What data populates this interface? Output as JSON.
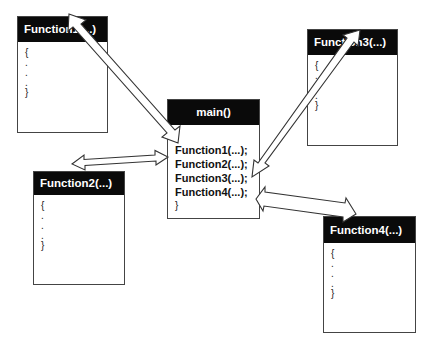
{
  "diagram": {
    "main": {
      "title": "main()",
      "lines": [
        "Function1(...);",
        "Function2(...);",
        "Function3(...);",
        "Function4(...);",
        "}"
      ]
    },
    "functions": [
      {
        "title": "Function1(...)",
        "lines": [
          "{",
          ".",
          ".",
          ".",
          "}"
        ]
      },
      {
        "title": "Function2(...)",
        "lines": [
          "{",
          ".",
          ".",
          ".",
          "}"
        ]
      },
      {
        "title": "Function3(...)",
        "lines": [
          "{",
          ".",
          ".",
          ".",
          "}"
        ]
      },
      {
        "title": "Function4(...)",
        "lines": [
          "{",
          ".",
          ".",
          ".",
          "}"
        ]
      }
    ],
    "arrows": [
      {
        "from": "main.Function1",
        "to": "Function1",
        "style": "double-headed"
      },
      {
        "from": "main.Function2",
        "to": "Function2",
        "style": "double-headed"
      },
      {
        "from": "main.Function3",
        "to": "Function3",
        "style": "double-headed"
      },
      {
        "from": "main.Function4",
        "to": "Function4",
        "style": "double-headed"
      }
    ],
    "colors": {
      "header_bg": "#0a0a0a",
      "header_text": "#ffffff",
      "border": "#444444",
      "background": "#ffffff"
    }
  }
}
